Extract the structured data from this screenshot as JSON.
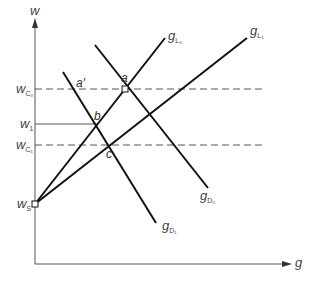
{
  "diagram": {
    "axes": {
      "y_label": "w",
      "x_label": "g"
    },
    "wage_levels": [
      {
        "id": "wC0",
        "base": "w",
        "sub": "C₀",
        "style": "dashed"
      },
      {
        "id": "w1",
        "base": "w",
        "sub": "1",
        "style": "solid"
      },
      {
        "id": "wC1",
        "base": "w",
        "sub": "C₁",
        "style": "dashed"
      },
      {
        "id": "wS",
        "base": "w",
        "sub": "S",
        "style": "point"
      }
    ],
    "curves": [
      {
        "id": "gL0",
        "base": "g",
        "sub": "L₀",
        "type": "supply"
      },
      {
        "id": "gL1",
        "base": "g",
        "sub": "L₁",
        "type": "supply"
      },
      {
        "id": "gD0",
        "base": "g",
        "sub": "D₀",
        "type": "demand"
      },
      {
        "id": "gD1",
        "base": "g",
        "sub": "D₁",
        "type": "demand"
      }
    ],
    "points": [
      {
        "id": "a",
        "label": "a"
      },
      {
        "id": "a_prime",
        "label": "a′"
      },
      {
        "id": "b",
        "label": "b"
      },
      {
        "id": "c",
        "label": "c"
      }
    ],
    "colors": {
      "line": "#111111",
      "dashed": "#555555",
      "axis": "#555555",
      "text": "#444444"
    }
  }
}
